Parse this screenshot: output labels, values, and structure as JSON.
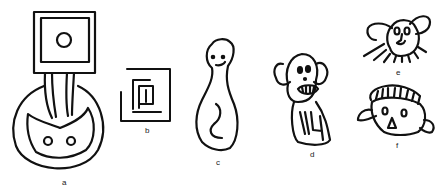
{
  "figure": {
    "panels": [
      {
        "id": "a",
        "label": "a",
        "description": "square with circle atop column within large circle"
      },
      {
        "id": "b",
        "label": "b",
        "description": "nested square spiral"
      },
      {
        "id": "c",
        "label": "c",
        "description": "smiling figure with curled line"
      },
      {
        "id": "d",
        "label": "d",
        "description": "face with teeth and body with lines"
      },
      {
        "id": "e",
        "label": "e",
        "description": "face with ears and radiating lines"
      },
      {
        "id": "f",
        "label": "f",
        "description": "face with striped crown and fins"
      }
    ],
    "stroke_color": "#111111",
    "background": "#ffffff"
  }
}
